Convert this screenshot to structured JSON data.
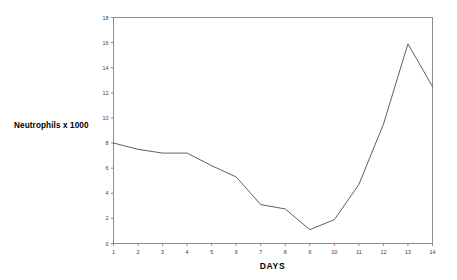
{
  "chart_data": {
    "type": "line",
    "title": "",
    "xlabel": "DAYS",
    "ylabel": "Neutrophils x 1000",
    "x": [
      1,
      2,
      3,
      4,
      5,
      6,
      7,
      8,
      9,
      10,
      11,
      12,
      13,
      14
    ],
    "categories": [
      "1",
      "2",
      "3",
      "4",
      "5",
      "6",
      "7",
      "8",
      "9",
      "10",
      "11",
      "12",
      "13",
      "14"
    ],
    "values": [
      8.0,
      7.5,
      7.2,
      7.2,
      6.2,
      5.3,
      3.1,
      2.75,
      1.1,
      1.9,
      4.7,
      9.5,
      15.9,
      12.5
    ],
    "series": [
      {
        "name": "Neutrophils x 1000",
        "values": [
          8.0,
          7.5,
          7.2,
          7.2,
          6.2,
          5.3,
          3.1,
          2.75,
          1.1,
          1.9,
          4.7,
          9.5,
          15.9,
          12.5
        ]
      }
    ],
    "xlim": [
      1,
      14
    ],
    "ylim": [
      0,
      18
    ],
    "ytick_labels": [
      "0",
      "2",
      "4",
      "6",
      "8",
      "10",
      "12",
      "14",
      "16",
      "18"
    ],
    "ytick_values": [
      0,
      2,
      4,
      6,
      8,
      10,
      12,
      14,
      16,
      18
    ],
    "xtick_labels": [
      "1",
      "2",
      "3",
      "4",
      "5",
      "6",
      "7",
      "8",
      "9",
      "10",
      "11",
      "12",
      "13",
      "14"
    ],
    "grid": false,
    "legend": false,
    "legend_position": "none",
    "line_color": "#4d4d4d",
    "axis_color": "#808080",
    "background_color": "#ffffff"
  }
}
